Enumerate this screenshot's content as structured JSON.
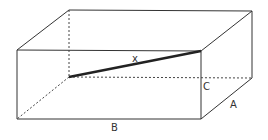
{
  "diagram": {
    "type": "rectangular-prism",
    "labels": {
      "diagonal": "x",
      "height": "C",
      "depth": "A",
      "width": "B"
    },
    "colors": {
      "edge": "#333333",
      "hidden_edge": "#444444",
      "diagonal": "#222222",
      "background": "#ffffff"
    }
  }
}
